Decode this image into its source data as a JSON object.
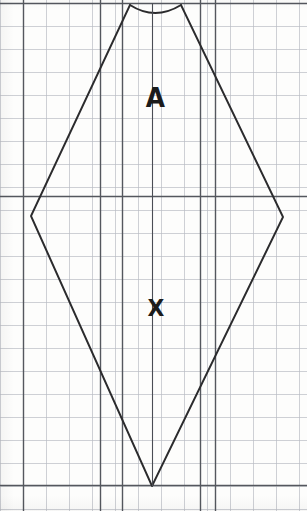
{
  "document": {
    "kind": "grid-paper-geometry-figure",
    "width": 307,
    "height": 511,
    "background_color": "#fdfdfc"
  },
  "grid": {
    "minor_spacing": 23,
    "minor_color": "#b9bcc4",
    "minor_width": 0.7,
    "major_color": "#54575e",
    "major_width": 1.4,
    "origin_x": 0,
    "origin_y": 3,
    "major_every": 4,
    "vertical_major_x": [
      23,
      100,
      122,
      200,
      215
    ],
    "horizontal_major_y": [
      3,
      196,
      485
    ],
    "columns": 13,
    "rows": 22
  },
  "figure": {
    "name": "kite-quadrilateral-with-concave-top-arc",
    "stroke_color": "#2b2b2d",
    "stroke_width": 1.9,
    "fill": "none",
    "vertices": [
      {
        "name": "top-left-peak",
        "x": 130,
        "y": 5
      },
      {
        "name": "top-right-peak",
        "x": 181,
        "y": 5
      },
      {
        "name": "right-vertex",
        "x": 283,
        "y": 217
      },
      {
        "name": "bottom-vertex",
        "x": 152,
        "y": 486
      },
      {
        "name": "left-vertex",
        "x": 31,
        "y": 216
      }
    ],
    "top_arc": {
      "name": "concave-top-arc",
      "from_x": 130,
      "from_y": 5,
      "to_x": 181,
      "to_y": 5,
      "control_x": 155,
      "control_y": 21,
      "curvature": "concave-downward"
    },
    "interior_vertical": {
      "name": "axis-of-symmetry",
      "x": 152,
      "y_top": 3,
      "y_bottom": 486,
      "visible": true
    }
  },
  "labels": [
    {
      "id": "label-a",
      "text": "A",
      "x": 145,
      "y": 84,
      "font_size": 27
    },
    {
      "id": "label-x",
      "text": "X",
      "x": 147,
      "y": 297,
      "font_size": 23
    }
  ]
}
